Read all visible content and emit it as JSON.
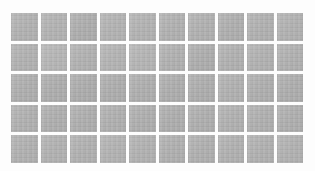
{
  "canvas": {
    "width": 315,
    "height": 171,
    "background_color": "#fdfdfd"
  },
  "grid": {
    "name": "tile-grid",
    "columns": 10,
    "rows": 5,
    "tile_count": 50,
    "left": 11,
    "top": 13,
    "width": 292,
    "height": 150,
    "tile_width": 26.2,
    "tile_height": 26.8,
    "gap_x": 3,
    "gap_y": 3,
    "tile_color": "#b0b0b0",
    "gap_color": "#fdfdfd"
  },
  "tiles": [
    {
      "row": 1,
      "col": 1,
      "color": "#b1b1b1"
    },
    {
      "row": 1,
      "col": 2,
      "color": "#b2b2b2"
    },
    {
      "row": 1,
      "col": 3,
      "color": "#adadad"
    },
    {
      "row": 1,
      "col": 4,
      "color": "#b2b2b2"
    },
    {
      "row": 1,
      "col": 5,
      "color": "#b2b2b2"
    },
    {
      "row": 1,
      "col": 6,
      "color": "#b0b0b0"
    },
    {
      "row": 1,
      "col": 7,
      "color": "#b0b0b0"
    },
    {
      "row": 1,
      "col": 8,
      "color": "#aeaeae"
    },
    {
      "row": 1,
      "col": 9,
      "color": "#b0b0b0"
    },
    {
      "row": 1,
      "col": 10,
      "color": "#b1b1b1"
    },
    {
      "row": 2,
      "col": 1,
      "color": "#b1b1b1"
    },
    {
      "row": 2,
      "col": 2,
      "color": "#b5b5b5"
    },
    {
      "row": 2,
      "col": 3,
      "color": "#b1b1b1"
    },
    {
      "row": 2,
      "col": 4,
      "color": "#b3b3b3"
    },
    {
      "row": 2,
      "col": 5,
      "color": "#b4b4b4"
    },
    {
      "row": 2,
      "col": 6,
      "color": "#b0b0b0"
    },
    {
      "row": 2,
      "col": 7,
      "color": "#adadad"
    },
    {
      "row": 2,
      "col": 8,
      "color": "#b0b0b0"
    },
    {
      "row": 2,
      "col": 9,
      "color": "#b1b1b1"
    },
    {
      "row": 2,
      "col": 10,
      "color": "#b0b0b0"
    },
    {
      "row": 3,
      "col": 1,
      "color": "#aeaeae"
    },
    {
      "row": 3,
      "col": 2,
      "color": "#adadad"
    },
    {
      "row": 3,
      "col": 3,
      "color": "#acacac"
    },
    {
      "row": 3,
      "col": 4,
      "color": "#adadad"
    },
    {
      "row": 3,
      "col": 5,
      "color": "#aeaeae"
    },
    {
      "row": 3,
      "col": 6,
      "color": "#adadad"
    },
    {
      "row": 3,
      "col": 7,
      "color": "#adadad"
    },
    {
      "row": 3,
      "col": 8,
      "color": "#b0b0b0"
    },
    {
      "row": 3,
      "col": 9,
      "color": "#aeaeae"
    },
    {
      "row": 3,
      "col": 10,
      "color": "#adadad"
    },
    {
      "row": 4,
      "col": 1,
      "color": "#b0b0b0"
    },
    {
      "row": 4,
      "col": 2,
      "color": "#aeaeae"
    },
    {
      "row": 4,
      "col": 3,
      "color": "#aeaeae"
    },
    {
      "row": 4,
      "col": 4,
      "color": "#afafaf"
    },
    {
      "row": 4,
      "col": 5,
      "color": "#aeaeae"
    },
    {
      "row": 4,
      "col": 6,
      "color": "#adadad"
    },
    {
      "row": 4,
      "col": 7,
      "color": "#aeaeae"
    },
    {
      "row": 4,
      "col": 8,
      "color": "#b0b0b0"
    },
    {
      "row": 4,
      "col": 9,
      "color": "#afafaf"
    },
    {
      "row": 4,
      "col": 10,
      "color": "#aeaeae"
    },
    {
      "row": 5,
      "col": 1,
      "color": "#b0b0b0"
    },
    {
      "row": 5,
      "col": 2,
      "color": "#b1b1b1"
    },
    {
      "row": 5,
      "col": 3,
      "color": "#b0b0b0"
    },
    {
      "row": 5,
      "col": 4,
      "color": "#b2b2b2"
    },
    {
      "row": 5,
      "col": 5,
      "color": "#b1b1b1"
    },
    {
      "row": 5,
      "col": 6,
      "color": "#afafaf"
    },
    {
      "row": 5,
      "col": 7,
      "color": "#afafaf"
    },
    {
      "row": 5,
      "col": 8,
      "color": "#b0b0b0"
    },
    {
      "row": 5,
      "col": 9,
      "color": "#b0b0b0"
    },
    {
      "row": 5,
      "col": 10,
      "color": "#b1b1b1"
    }
  ]
}
